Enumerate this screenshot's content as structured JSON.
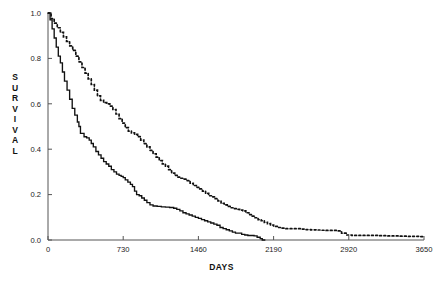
{
  "chart_data": {
    "type": "line",
    "title": "",
    "xlabel": "DAYS",
    "ylabel": "SURVIVAL",
    "ylabel_letters": [
      "S",
      "U",
      "R",
      "V",
      "I",
      "V",
      "A",
      "L"
    ],
    "xlim": [
      0,
      3650
    ],
    "ylim": [
      0.0,
      1.0
    ],
    "grid": false,
    "legend": "none",
    "xticks": [
      0,
      730,
      1460,
      2190,
      2920,
      3650
    ],
    "xticklabels": [
      "0",
      "730",
      "1460",
      "2190",
      "2920",
      "3650"
    ],
    "yticks": [
      0.0,
      0.2,
      0.4,
      0.6,
      0.8,
      1.0
    ],
    "yticklabels": [
      "0.0",
      "0.2",
      "0.4",
      "0.6",
      "0.8",
      "1.0"
    ],
    "colors": {
      "curve": "#111111",
      "axis": "#555555"
    },
    "series": [
      {
        "name": "solid-curve",
        "style": "solid",
        "points": [
          [
            0,
            1.0
          ],
          [
            20,
            0.97
          ],
          [
            40,
            0.93
          ],
          [
            60,
            0.89
          ],
          [
            80,
            0.85
          ],
          [
            100,
            0.81
          ],
          [
            120,
            0.78
          ],
          [
            140,
            0.74
          ],
          [
            160,
            0.7
          ],
          [
            185,
            0.66
          ],
          [
            210,
            0.62
          ],
          [
            235,
            0.58
          ],
          [
            260,
            0.55
          ],
          [
            285,
            0.52
          ],
          [
            300,
            0.5
          ],
          [
            315,
            0.47
          ],
          [
            330,
            0.47
          ],
          [
            350,
            0.455
          ],
          [
            375,
            0.45
          ],
          [
            400,
            0.44
          ],
          [
            420,
            0.425
          ],
          [
            440,
            0.41
          ],
          [
            465,
            0.39
          ],
          [
            490,
            0.375
          ],
          [
            515,
            0.36
          ],
          [
            540,
            0.345
          ],
          [
            565,
            0.335
          ],
          [
            590,
            0.325
          ],
          [
            615,
            0.31
          ],
          [
            640,
            0.3
          ],
          [
            665,
            0.29
          ],
          [
            690,
            0.285
          ],
          [
            710,
            0.28
          ],
          [
            730,
            0.275
          ],
          [
            750,
            0.265
          ],
          [
            775,
            0.255
          ],
          [
            800,
            0.245
          ],
          [
            820,
            0.235
          ],
          [
            840,
            0.215
          ],
          [
            860,
            0.2
          ],
          [
            885,
            0.195
          ],
          [
            910,
            0.185
          ],
          [
            935,
            0.175
          ],
          [
            960,
            0.165
          ],
          [
            990,
            0.155
          ],
          [
            1020,
            0.15
          ],
          [
            1060,
            0.148
          ],
          [
            1100,
            0.146
          ],
          [
            1140,
            0.145
          ],
          [
            1180,
            0.143
          ],
          [
            1220,
            0.14
          ],
          [
            1250,
            0.135
          ],
          [
            1280,
            0.128
          ],
          [
            1310,
            0.12
          ],
          [
            1340,
            0.115
          ],
          [
            1370,
            0.11
          ],
          [
            1400,
            0.105
          ],
          [
            1430,
            0.1
          ],
          [
            1460,
            0.095
          ],
          [
            1490,
            0.09
          ],
          [
            1520,
            0.085
          ],
          [
            1550,
            0.08
          ],
          [
            1580,
            0.075
          ],
          [
            1610,
            0.07
          ],
          [
            1640,
            0.065
          ],
          [
            1670,
            0.055
          ],
          [
            1700,
            0.05
          ],
          [
            1730,
            0.045
          ],
          [
            1760,
            0.04
          ],
          [
            1790,
            0.035
          ],
          [
            1820,
            0.03
          ],
          [
            1850,
            0.03
          ],
          [
            1880,
            0.025
          ],
          [
            1910,
            0.022
          ],
          [
            1940,
            0.02
          ],
          [
            1970,
            0.02
          ],
          [
            2000,
            0.018
          ],
          [
            2030,
            0.012
          ],
          [
            2060,
            0.006
          ],
          [
            2080,
            0.0
          ],
          [
            2110,
            0.0
          ]
        ]
      },
      {
        "name": "dotted-curve",
        "style": "dotted",
        "points": [
          [
            0,
            1.0
          ],
          [
            30,
            0.975
          ],
          [
            60,
            0.955
          ],
          [
            90,
            0.935
          ],
          [
            120,
            0.915
          ],
          [
            150,
            0.895
          ],
          [
            180,
            0.875
          ],
          [
            210,
            0.855
          ],
          [
            240,
            0.835
          ],
          [
            270,
            0.81
          ],
          [
            300,
            0.785
          ],
          [
            330,
            0.76
          ],
          [
            360,
            0.735
          ],
          [
            390,
            0.71
          ],
          [
            420,
            0.685
          ],
          [
            450,
            0.66
          ],
          [
            480,
            0.635
          ],
          [
            510,
            0.615
          ],
          [
            540,
            0.605
          ],
          [
            570,
            0.6
          ],
          [
            600,
            0.59
          ],
          [
            630,
            0.575
          ],
          [
            660,
            0.555
          ],
          [
            690,
            0.535
          ],
          [
            720,
            0.515
          ],
          [
            750,
            0.495
          ],
          [
            780,
            0.48
          ],
          [
            810,
            0.472
          ],
          [
            840,
            0.465
          ],
          [
            870,
            0.455
          ],
          [
            900,
            0.44
          ],
          [
            930,
            0.425
          ],
          [
            960,
            0.41
          ],
          [
            990,
            0.395
          ],
          [
            1020,
            0.38
          ],
          [
            1050,
            0.365
          ],
          [
            1080,
            0.35
          ],
          [
            1110,
            0.335
          ],
          [
            1140,
            0.325
          ],
          [
            1170,
            0.31
          ],
          [
            1200,
            0.295
          ],
          [
            1230,
            0.285
          ],
          [
            1260,
            0.277
          ],
          [
            1290,
            0.272
          ],
          [
            1320,
            0.268
          ],
          [
            1350,
            0.262
          ],
          [
            1380,
            0.25
          ],
          [
            1410,
            0.24
          ],
          [
            1440,
            0.232
          ],
          [
            1470,
            0.225
          ],
          [
            1500,
            0.215
          ],
          [
            1530,
            0.205
          ],
          [
            1560,
            0.195
          ],
          [
            1590,
            0.19
          ],
          [
            1620,
            0.182
          ],
          [
            1650,
            0.172
          ],
          [
            1680,
            0.162
          ],
          [
            1710,
            0.155
          ],
          [
            1740,
            0.148
          ],
          [
            1770,
            0.142
          ],
          [
            1800,
            0.138
          ],
          [
            1830,
            0.135
          ],
          [
            1860,
            0.132
          ],
          [
            1890,
            0.128
          ],
          [
            1920,
            0.12
          ],
          [
            1950,
            0.112
          ],
          [
            1980,
            0.105
          ],
          [
            2010,
            0.098
          ],
          [
            2040,
            0.09
          ],
          [
            2070,
            0.085
          ],
          [
            2100,
            0.078
          ],
          [
            2130,
            0.072
          ],
          [
            2160,
            0.066
          ],
          [
            2190,
            0.06
          ],
          [
            2230,
            0.055
          ],
          [
            2270,
            0.052
          ],
          [
            2310,
            0.05
          ],
          [
            2350,
            0.05
          ],
          [
            2400,
            0.05
          ],
          [
            2450,
            0.048
          ],
          [
            2500,
            0.046
          ],
          [
            2550,
            0.045
          ],
          [
            2600,
            0.044
          ],
          [
            2650,
            0.043
          ],
          [
            2700,
            0.042
          ],
          [
            2750,
            0.042
          ],
          [
            2800,
            0.04
          ],
          [
            2850,
            0.03
          ],
          [
            2900,
            0.022
          ],
          [
            2950,
            0.02
          ],
          [
            3000,
            0.02
          ],
          [
            3100,
            0.02
          ],
          [
            3200,
            0.019
          ],
          [
            3300,
            0.018
          ],
          [
            3400,
            0.017
          ],
          [
            3500,
            0.016
          ],
          [
            3600,
            0.015
          ],
          [
            3650,
            0.014
          ]
        ]
      }
    ]
  }
}
